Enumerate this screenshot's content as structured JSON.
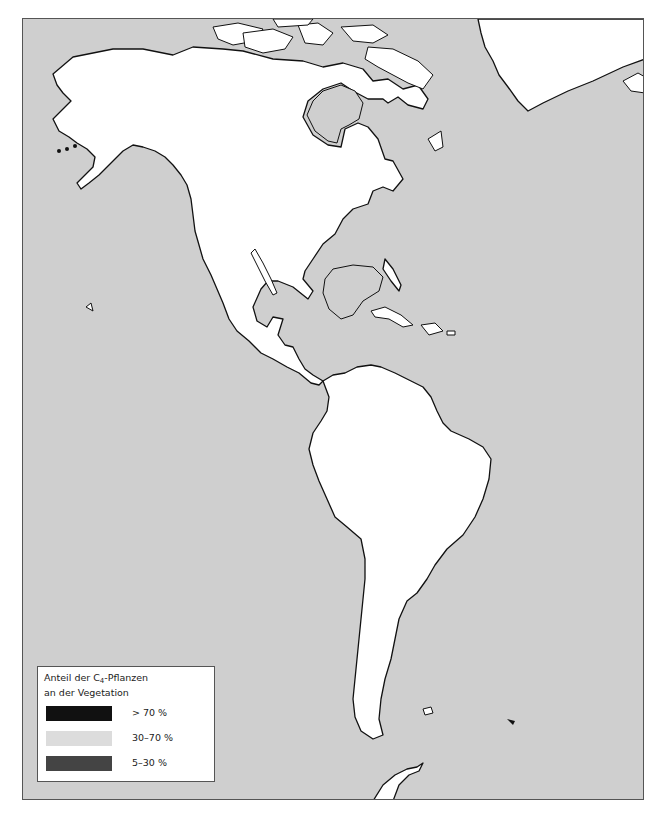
{
  "map": {
    "title": "Anteil der C4-Pflanzen an der Vegetation — Amerika",
    "region": "Americas",
    "ocean_color": "#cfcfcf",
    "land_color": "#ffffff",
    "outline_color": "#111111"
  },
  "legend": {
    "title_line1_prefix": "Anteil der  C",
    "title_line1_sub": "4",
    "title_line1_suffix": "-Pflanzen",
    "title_line2": "an der Vegetation",
    "items": [
      {
        "label": "> 70 %",
        "color": "#111111"
      },
      {
        "label": "30–70 %",
        "color": "#dcdcdc"
      },
      {
        "label": "5–30 %",
        "color": "#444444"
      }
    ]
  }
}
